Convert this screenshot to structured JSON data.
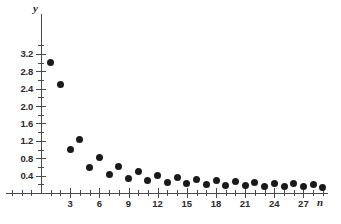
{
  "chart_data": {
    "type": "scatter",
    "title": "",
    "xlabel": "n",
    "ylabel": "y",
    "grid": false,
    "legend": null,
    "xlim": [
      0,
      30
    ],
    "ylim": [
      0,
      3.4
    ],
    "x_ticks_labeled": [
      3,
      6,
      9,
      12,
      15,
      18,
      21,
      24,
      27
    ],
    "x_tick_step": 1,
    "y_ticks_labeled": [
      0.4,
      0.8,
      1.2,
      1.6,
      2.0,
      2.4,
      2.8,
      3.2
    ],
    "y_tick_minor_step": 0.2,
    "x": [
      1,
      2,
      3,
      4,
      5,
      6,
      7,
      8,
      9,
      10,
      11,
      12,
      13,
      14,
      15,
      16,
      17,
      18,
      19,
      20,
      21,
      22,
      23,
      24,
      25,
      26,
      27,
      28,
      29
    ],
    "values": [
      3.0,
      2.5,
      1.0,
      1.24,
      0.59,
      0.82,
      0.43,
      0.62,
      0.33,
      0.49,
      0.28,
      0.41,
      0.25,
      0.36,
      0.22,
      0.31,
      0.2,
      0.29,
      0.18,
      0.27,
      0.17,
      0.24,
      0.15,
      0.22,
      0.15,
      0.21,
      0.14,
      0.2,
      0.13
    ],
    "y_tick_labels": [
      "0.4",
      "0.8",
      "1.2",
      "1.6",
      "2.0",
      "2.4",
      "2.8",
      "3.2"
    ],
    "x_tick_labels": [
      "3",
      "6",
      "9",
      "12",
      "15",
      "18",
      "21",
      "24",
      "27"
    ],
    "marker": "filled-circle",
    "marker_color": "#1a1a1a",
    "axis_color": "#4a4a4a",
    "background_color": "#ffffff"
  }
}
